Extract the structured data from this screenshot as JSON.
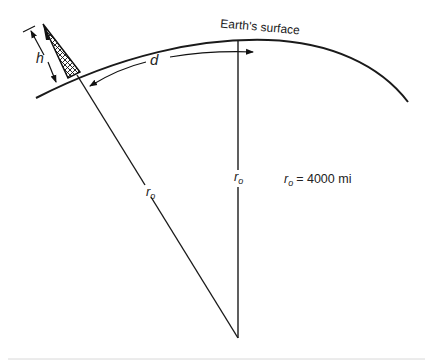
{
  "diagram": {
    "surface_label": "Earth's surface",
    "height_label": "h",
    "distance_label": "d",
    "radius_label": "r",
    "radius_subscript": "o",
    "legend": {
      "symbol": "r",
      "subscript": "o",
      "value": "= 4000 mi"
    },
    "colors": {
      "line": "#1a1a1a",
      "background": "#ffffff"
    }
  }
}
